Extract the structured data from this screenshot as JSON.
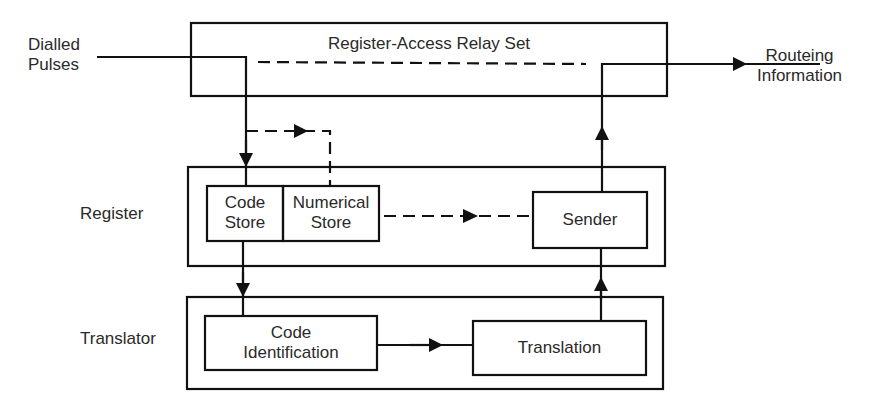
{
  "inputs": {
    "dialled_pulses": [
      "Dialled",
      "Pulses"
    ]
  },
  "outputs": {
    "routeing_information": [
      "Routeing",
      "Information"
    ]
  },
  "blocks": {
    "relay_set": {
      "title": "Register-Access Relay Set"
    },
    "register": {
      "label": "Register",
      "code_store": [
        "Code",
        "Store"
      ],
      "numerical_store": [
        "Numerical",
        "Store"
      ],
      "sender": "Sender"
    },
    "translator": {
      "label": "Translator",
      "code_identification": [
        "Code",
        "Identification"
      ],
      "translation": "Translation"
    }
  },
  "colors": {
    "line": "#111111",
    "text": "#2a2a2a",
    "background": "#ffffff"
  }
}
